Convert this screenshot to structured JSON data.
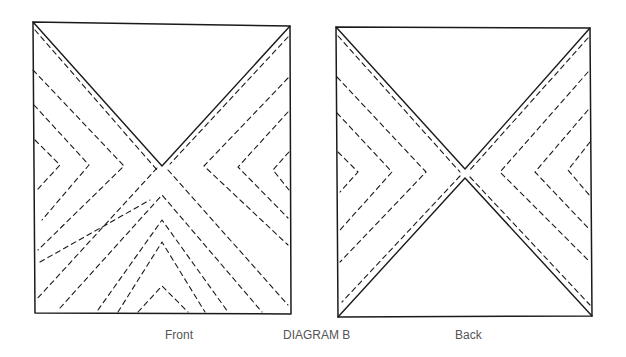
{
  "diagram": {
    "title": "DIAGRAM B",
    "panels": [
      {
        "id": "front",
        "label": "Front"
      },
      {
        "id": "back",
        "label": "Back"
      }
    ],
    "colors": {
      "ink": "#1a1a1a",
      "label": "#555555",
      "background": "#ffffff"
    }
  }
}
